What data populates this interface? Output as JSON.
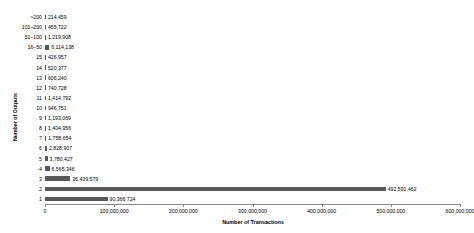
{
  "chart_data": {
    "type": "bar",
    "orientation": "horizontal",
    "title": "",
    "xlabel": "Number of Transactions",
    "ylabel": "Number of Outputs",
    "xlim": [
      0,
      600000000
    ],
    "xticks": [
      0,
      100000000,
      200000000,
      300000000,
      400000000,
      500000000,
      600000000
    ],
    "xtick_labels": [
      "0",
      "100,000,000",
      "200,000,000",
      "300,000,000",
      "400,000,000",
      "500,000,000",
      "600,000,000"
    ],
    "grid": false,
    "legend": null,
    "bar_color": "#595959",
    "categories": [
      ">200",
      "101–200",
      "51–100",
      "16–50",
      "15",
      "14",
      "13",
      "12",
      "11",
      "10",
      "9",
      "8",
      "7",
      "6",
      "5",
      "4",
      "3",
      "2",
      "1"
    ],
    "values": [
      214459,
      455722,
      1219908,
      6114138,
      426957,
      520377,
      606240,
      740728,
      1414792,
      946751,
      1193069,
      1404956,
      1758654,
      2828907,
      3780427,
      6565346,
      36439579,
      492591462,
      90366724
    ],
    "value_labels": [
      "214,459",
      "455,722",
      "1,219,908",
      "6,114,138",
      "426,957",
      "520,377",
      "606,240",
      "740,728",
      "1,414,792",
      "946,751",
      "1,193,069",
      "1,404,956",
      "1,758,654",
      "2,828,907",
      "3,780,427",
      "6,565,346",
      "36,439,579",
      "492,591,462",
      "90,366,724"
    ]
  }
}
